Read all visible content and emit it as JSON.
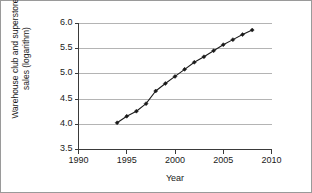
{
  "chart_data": {
    "type": "line",
    "title": "",
    "xlabel": "Year",
    "ylabel": "Warehouse club and superstore\nsales (logarithm)",
    "xlim": [
      1990,
      2010
    ],
    "ylim": [
      3.5,
      6.0
    ],
    "xticks": [
      "1990",
      "1995",
      "2000",
      "2005",
      "2010"
    ],
    "yticks": [
      "3.5",
      "4.0",
      "4.5",
      "5.0",
      "5.5",
      "6.0"
    ],
    "grid": "horizontal",
    "legend": "none",
    "marker": "filled-diamond",
    "line_color": "#1a1a1a",
    "grid_color": "#b4b4b4",
    "x": [
      1994,
      1995,
      1996,
      1997,
      1998,
      1999,
      2000,
      2001,
      2002,
      2003,
      2004,
      2005,
      2006,
      2007,
      2008
    ],
    "values": [
      4.03,
      4.16,
      4.26,
      4.41,
      4.66,
      4.81,
      4.95,
      5.09,
      5.23,
      5.34,
      5.46,
      5.58,
      5.68,
      5.78,
      5.87
    ],
    "series": [
      {
        "name": "Warehouse club and superstore sales (logarithm)",
        "values": [
          4.03,
          4.16,
          4.26,
          4.41,
          4.66,
          4.81,
          4.95,
          5.09,
          5.23,
          5.34,
          5.46,
          5.58,
          5.68,
          5.78,
          5.87
        ]
      }
    ]
  },
  "axes": {
    "y_title": "Warehouse club and superstore\nsales (logarithm)",
    "x_title": "Year"
  }
}
